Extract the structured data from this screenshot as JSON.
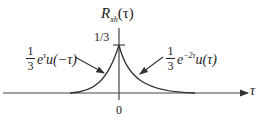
{
  "diagram": {
    "title_main": "R",
    "title_sub": "xh",
    "title_arg": "(τ)",
    "peak_label": "1/3",
    "origin_label": "0",
    "x_axis_label": "τ",
    "left_label": {
      "num": "1",
      "den": "3",
      "base": "e",
      "exp": "τ",
      "rest": "u(−τ)"
    },
    "right_label": {
      "num": "1",
      "den": "3",
      "base": "e",
      "exp": "−2τ",
      "rest": "u(τ)"
    },
    "colors": {
      "line": "#333333",
      "background": "#ffffff"
    }
  }
}
